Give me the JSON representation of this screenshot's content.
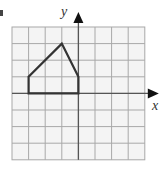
{
  "figure": {
    "axis_labels": {
      "x": "x",
      "y": "y"
    },
    "grid": {
      "columns": 8,
      "rows": 8,
      "origin_col": 4,
      "origin_row": 4
    },
    "shape": {
      "type": "pentagon",
      "vertices": [
        [
          -3,
          0
        ],
        [
          -3,
          1
        ],
        [
          -1,
          3
        ],
        [
          0,
          1
        ],
        [
          0,
          0
        ]
      ]
    },
    "colors": {
      "grid": "#a8a8a8",
      "axis": "#555555",
      "shape": "#333333",
      "background": "#f4f4f4"
    }
  }
}
